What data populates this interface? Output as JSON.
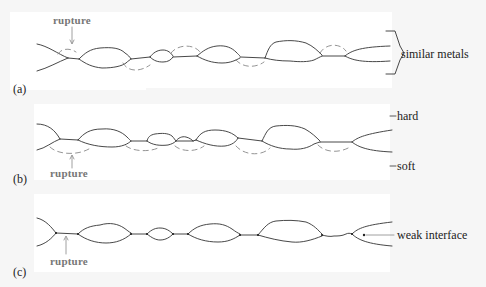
{
  "figure": {
    "colors": {
      "background": "#f6f6f6",
      "panel": "#ffffff",
      "line": "#333333",
      "dashed_rupture": "#888888",
      "rupture_text": "#777777",
      "label_text": "#222222"
    },
    "panels": [
      {
        "id": "a",
        "letter": "(a)",
        "rupture_label": "rupture",
        "side_label": "similar metals",
        "description": "Junctions between similar metals; rupture occurs in either surface (dashed arcs above and below)"
      },
      {
        "id": "b",
        "letter": "(b)",
        "rupture_label": "rupture",
        "upper_label": "hard",
        "lower_label": "soft",
        "description": "Hard metal on soft metal; rupture occurs in the softer (lower) metal"
      },
      {
        "id": "c",
        "letter": "(c)",
        "rupture_label": "rupture",
        "side_label": "weak interface",
        "description": "Weak interface; rupture occurs at the interface itself"
      }
    ]
  }
}
